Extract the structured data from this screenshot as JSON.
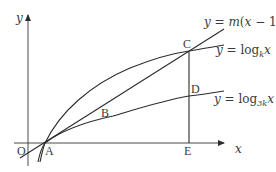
{
  "axes": {
    "x_label": "x",
    "y_label": "y",
    "origin_label": "O"
  },
  "points": {
    "A": "A",
    "B": "B",
    "C": "C",
    "D": "D",
    "E": "E"
  },
  "curves": {
    "line": {
      "prefix": "y = ",
      "m": "m",
      "open": "(",
      "x": "x",
      "rest": " − 1)"
    },
    "log_k": {
      "prefix": "y = log",
      "base": "k",
      "arg": "x"
    },
    "log_3k": {
      "prefix": "y = log",
      "base": "3k",
      "arg": "x"
    }
  },
  "colors": {
    "stroke": "#2b2b2b",
    "axis": "#4a4a4a",
    "text": "#3a3a3a",
    "background": "#ffffff"
  }
}
